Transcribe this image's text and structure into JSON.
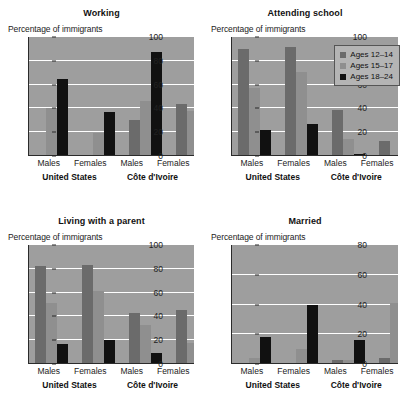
{
  "figure": {
    "axis_caption": "Percentage of immigrants",
    "groups": [
      "Males",
      "Females",
      "Males",
      "Females"
    ],
    "countries": [
      "United States",
      "Côte d'Ivoire"
    ],
    "legend": {
      "items": [
        {
          "label": "Ages 12–14",
          "color": "#6b6b6b"
        },
        {
          "label": "Ages 15–17",
          "color": "#8f8f8f"
        },
        {
          "label": "Ages 18–24",
          "color": "#111111"
        }
      ]
    }
  },
  "chart_data": [
    {
      "type": "bar",
      "title": "Working",
      "ylabel": "Percentage of immigrants",
      "xlabel": "",
      "ylim": [
        0,
        100
      ],
      "yticks": [
        0,
        20,
        40,
        60,
        80,
        100
      ],
      "grid": true,
      "legend_position": "none",
      "categories": [
        "United States Males",
        "United States Females",
        "Côte d'Ivoire Males",
        "Côte d'Ivoire Females"
      ],
      "group_labels": [
        "Males",
        "Females",
        "Males",
        "Females"
      ],
      "country_labels": [
        "United States",
        "Côte d'Ivoire"
      ],
      "series": [
        {
          "name": "Ages 12–14",
          "values": [
            0,
            0,
            30,
            44
          ]
        },
        {
          "name": "Ages 15–17",
          "values": [
            40,
            19,
            46,
            38
          ]
        },
        {
          "name": "Ages 18–24",
          "values": [
            65,
            37,
            87,
            38
          ]
        }
      ]
    },
    {
      "type": "bar",
      "title": "Attending school",
      "ylabel": "Percentage of immigrants",
      "xlabel": "",
      "ylim": [
        0,
        100
      ],
      "yticks": [
        0,
        20,
        40,
        60,
        80,
        100
      ],
      "grid": true,
      "legend_position": "top-right",
      "categories": [
        "United States Males",
        "United States Females",
        "Côte d'Ivoire Males",
        "Côte d'Ivoire Females"
      ],
      "group_labels": [
        "Males",
        "Females",
        "Males",
        "Females"
      ],
      "country_labels": [
        "United States",
        "Côte d'Ivoire"
      ],
      "series": [
        {
          "name": "Ages 12–14",
          "values": [
            90,
            92,
            39,
            13
          ]
        },
        {
          "name": "Ages 15–17",
          "values": [
            57,
            71,
            14,
            0
          ]
        },
        {
          "name": "Ages 18–24",
          "values": [
            22,
            27,
            2,
            1
          ]
        }
      ]
    },
    {
      "type": "bar",
      "title": "Living with a parent",
      "ylabel": "Percentage of immigrants",
      "xlabel": "",
      "ylim": [
        0,
        100
      ],
      "yticks": [
        0,
        20,
        40,
        60,
        80,
        100
      ],
      "grid": true,
      "legend_position": "none",
      "categories": [
        "United States Males",
        "United States Females",
        "Côte d'Ivoire Males",
        "Côte d'Ivoire Females"
      ],
      "group_labels": [
        "Males",
        "Females",
        "Males",
        "Females"
      ],
      "country_labels": [
        "United States",
        "Côte d'Ivoire"
      ],
      "series": [
        {
          "name": "Ages 12–14",
          "values": [
            82,
            83,
            43,
            45
          ]
        },
        {
          "name": "Ages 15–17",
          "values": [
            51,
            61,
            33,
            18
          ]
        },
        {
          "name": "Ages 18–24",
          "values": [
            17,
            20,
            9,
            6
          ]
        }
      ]
    },
    {
      "type": "bar",
      "title": "Married",
      "ylabel": "Percentage of immigrants",
      "xlabel": "",
      "ylim": [
        0,
        80
      ],
      "yticks": [
        0,
        20,
        40,
        60,
        80
      ],
      "grid": true,
      "legend_position": "none",
      "categories": [
        "United States Males",
        "United States Females",
        "Côte d'Ivoire Males",
        "Côte d'Ivoire Females"
      ],
      "group_labels": [
        "Males",
        "Females",
        "Males",
        "Females"
      ],
      "country_labels": [
        "United States",
        "Côte d'Ivoire"
      ],
      "series": [
        {
          "name": "Ages 12–14",
          "values": [
            0,
            0,
            3,
            4
          ]
        },
        {
          "name": "Ages 15–17",
          "values": [
            4,
            10,
            3,
            41
          ]
        },
        {
          "name": "Ages 18–24",
          "values": [
            18,
            40,
            16,
            76
          ]
        }
      ]
    }
  ]
}
